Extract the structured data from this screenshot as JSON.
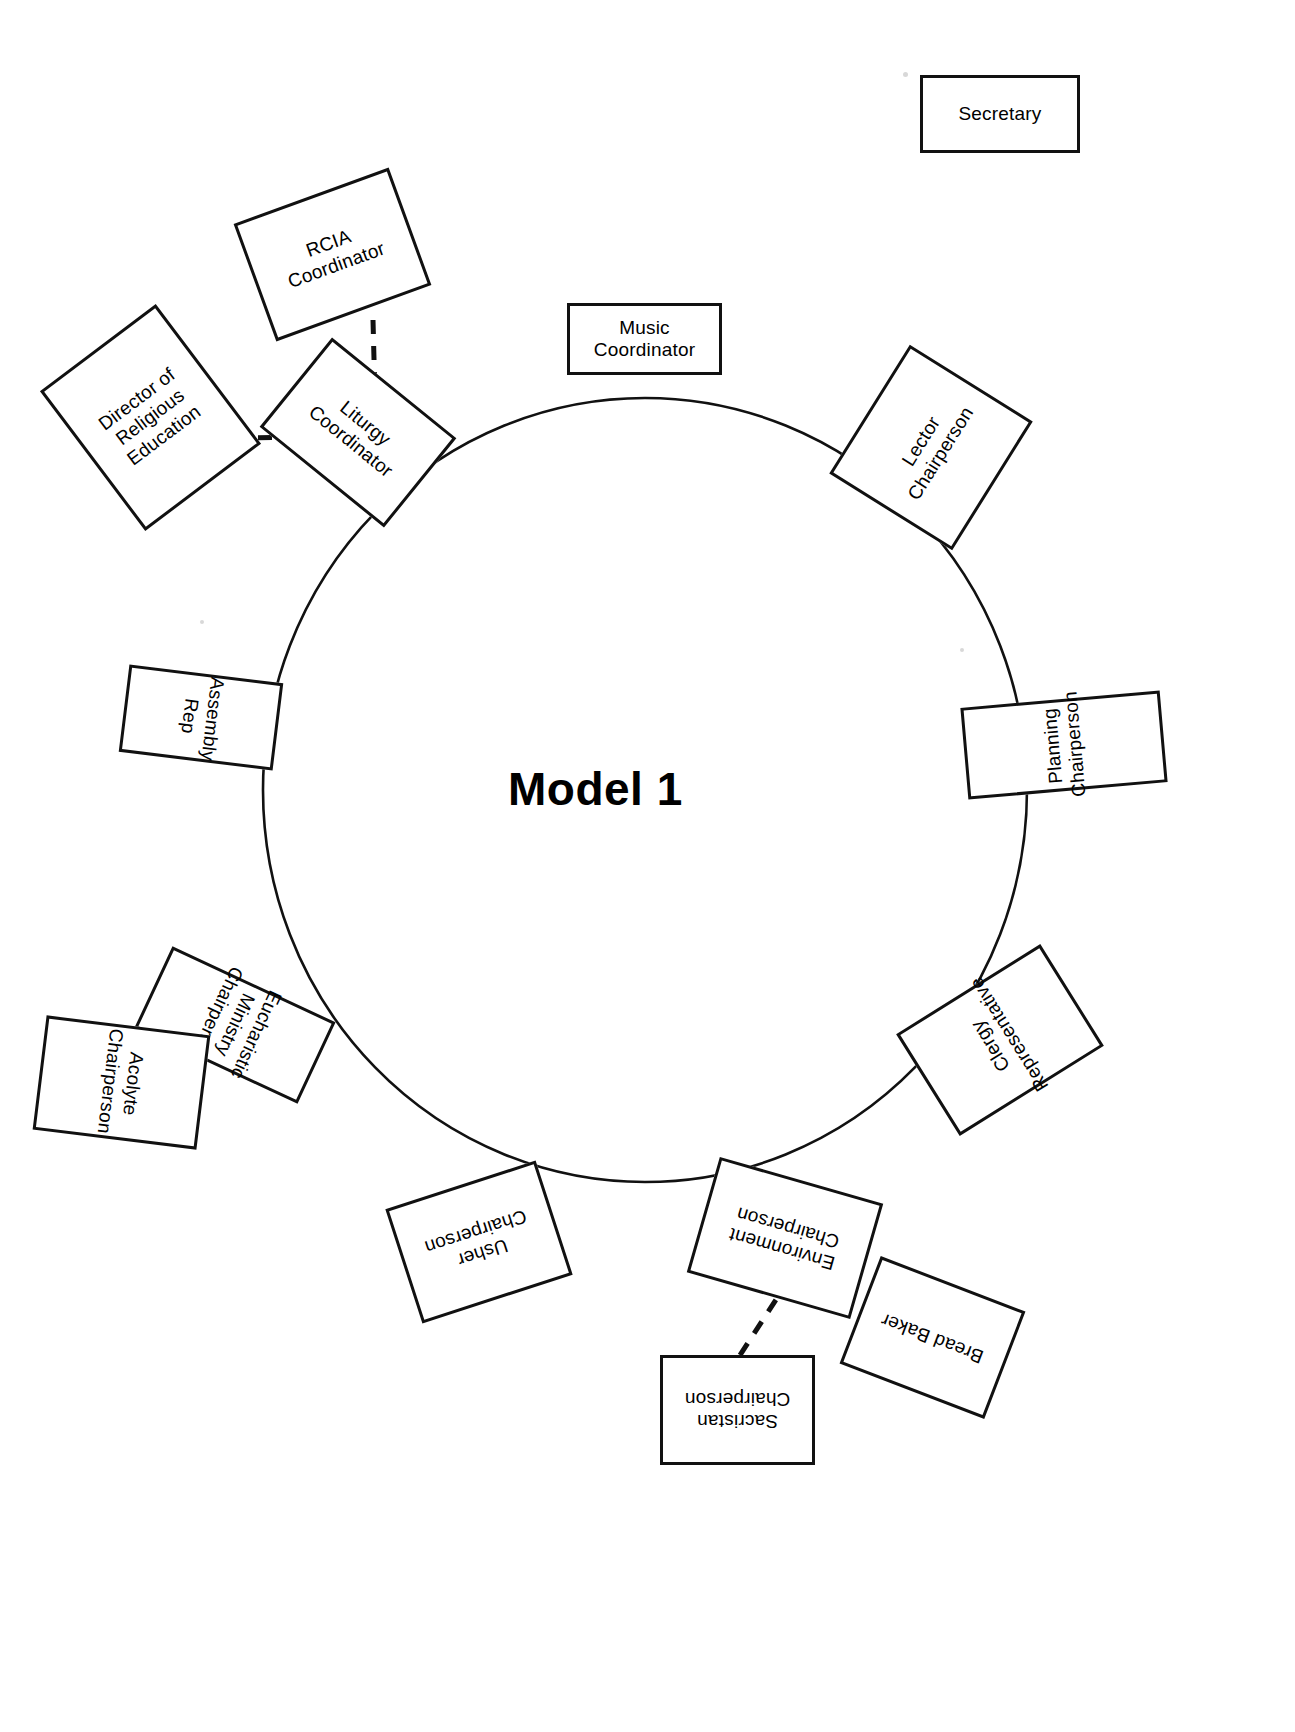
{
  "diagram": {
    "title": "Model 1",
    "type": "circular-organization-chart",
    "center": {
      "x": 645,
      "y": 790
    },
    "circle_radius": 385
  },
  "standalone": {
    "secretary": {
      "label": "Secretary",
      "x": 920,
      "y": 75,
      "w": 160,
      "h": 78,
      "rot": 0
    }
  },
  "ring_nodes": [
    {
      "name": "music-coordinator",
      "label": "Music\nCoordinator",
      "x": 567,
      "y": 303,
      "w": 155,
      "h": 72,
      "rot": 0
    },
    {
      "name": "lector-chairperson",
      "label": "Lector\nChairperson",
      "x": 855,
      "y": 375,
      "w": 152,
      "h": 145,
      "rot": -58
    },
    {
      "name": "planning-chairperson",
      "label": "Planning\nChairperson",
      "x": 1018,
      "y": 645,
      "w": 92,
      "h": 200,
      "rot": -95
    },
    {
      "name": "clergy-representative",
      "label": "Clergy\nRepresentative",
      "x": 940,
      "y": 955,
      "w": 120,
      "h": 170,
      "rot": -122
    },
    {
      "name": "environment-chairperson",
      "label": "Environment\nChairperson",
      "x": 700,
      "y": 1178,
      "w": 170,
      "h": 120,
      "rot": 196
    },
    {
      "name": "usher-chairperson",
      "label": "Usher\nChairperson",
      "x": 400,
      "y": 1182,
      "w": 158,
      "h": 120,
      "rot": 162
    },
    {
      "name": "eucharistic-ministry-chairperson",
      "label": "Eucharistic\nMinistry\nChairperson",
      "x": 190,
      "y": 935,
      "w": 90,
      "h": 180,
      "rot": 115
    },
    {
      "name": "assembly-rep",
      "label": "Assembly\nRep",
      "x": 157,
      "y": 640,
      "w": 88,
      "h": 155,
      "rot": 97
    },
    {
      "name": "liturgy-coordinator",
      "label": "Liturgy\nCoordinator",
      "x": 278,
      "y": 375,
      "w": 160,
      "h": 115,
      "rot": 39
    }
  ],
  "satellite_nodes": [
    {
      "name": "rcia-coordinator",
      "label": "RCIA\nCoordinator",
      "x": 250,
      "y": 192,
      "w": 165,
      "h": 125,
      "rot": -20
    },
    {
      "name": "director-of-religious-education",
      "label": "Director of\nReligious\nEducation",
      "x": 78,
      "y": 330,
      "w": 145,
      "h": 175,
      "rot": -37
    },
    {
      "name": "acolyte-chairperson",
      "label": "Acolyte\nChairperson",
      "x": 64,
      "y": 1000,
      "w": 115,
      "h": 165,
      "rot": 97
    },
    {
      "name": "sacristan-chairperson",
      "label": "Sacristan\nChairperson",
      "x": 660,
      "y": 1355,
      "w": 155,
      "h": 110,
      "rot": 180
    },
    {
      "name": "bread-baker",
      "label": "Bread Baker",
      "x": 855,
      "y": 1280,
      "w": 155,
      "h": 115,
      "rot": 201
    }
  ],
  "connections": [
    {
      "name": "rcia-to-liturgy",
      "from": "rcia-coordinator",
      "to": "liturgy-coordinator",
      "style": "dashed"
    },
    {
      "name": "director-to-liturgy",
      "from": "director-of-religious-education",
      "to": "liturgy-coordinator",
      "style": "dashed"
    },
    {
      "name": "acolyte-to-eucharistic",
      "from": "acolyte-chairperson",
      "to": "eucharistic-ministry-chairperson",
      "style": "dashed"
    },
    {
      "name": "environment-to-sacristan",
      "from": "environment-chairperson",
      "to": "sacristan-chairperson",
      "style": "dashed"
    },
    {
      "name": "environment-to-bread-baker",
      "from": "environment-chairperson",
      "to": "bread-baker",
      "style": "dashed"
    }
  ],
  "colors": {
    "stroke": "#111111",
    "background": "#ffffff",
    "text": "#000000"
  }
}
